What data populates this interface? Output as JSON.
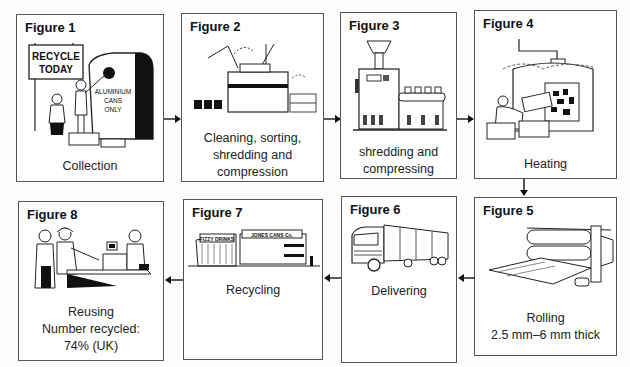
{
  "figures": [
    {
      "id": 1,
      "title": "Figure 1",
      "caption": [
        "Collection"
      ],
      "art": {
        "sign_lines": [
          "RECYCLE",
          "TODAY"
        ],
        "bin_lines": [
          "ALUMINIUM",
          "CANS",
          "ONLY"
        ]
      }
    },
    {
      "id": 2,
      "title": "Figure 2",
      "caption": [
        "Cleaning, sorting,",
        "shredding and",
        "compression"
      ]
    },
    {
      "id": 3,
      "title": "Figure 3",
      "caption": [
        "shredding and",
        "compressing"
      ]
    },
    {
      "id": 4,
      "title": "Figure 4",
      "caption": [
        "Heating"
      ]
    },
    {
      "id": 5,
      "title": "Figure 5",
      "caption": [
        "Rolling",
        "2.5 mm–6 mm thick"
      ]
    },
    {
      "id": 6,
      "title": "Figure 6",
      "caption": [
        "Delivering"
      ]
    },
    {
      "id": 7,
      "title": "Figure 7",
      "caption": [
        "Recycling"
      ],
      "art": {
        "sign_left": "FIZZY DRINKS",
        "sign_right": "JONES CANS Co."
      }
    },
    {
      "id": 8,
      "title": "Figure 8",
      "caption": [
        "Reusing",
        "Number recycled:",
        "74% (UK)"
      ]
    }
  ],
  "flow": [
    "1→2",
    "2→3",
    "3→4",
    "4→5",
    "5→6",
    "6→7",
    "7→8"
  ],
  "colors": {
    "border": "#555555",
    "arrow": "#111111",
    "background": "#ffffff"
  }
}
